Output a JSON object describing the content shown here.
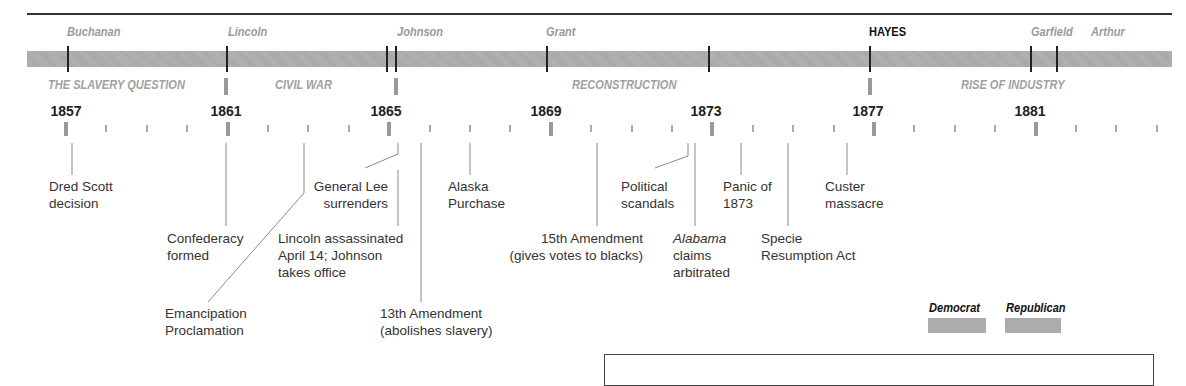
{
  "chart_data": {
    "type": "timeline",
    "title": "",
    "x_axis": {
      "start_year": 1857,
      "end_year": 1884,
      "labeled_years": [
        1857,
        1861,
        1865,
        1869,
        1873,
        1877,
        1881
      ],
      "minor_tick_interval_years": 1
    },
    "presidents": [
      {
        "name": "Buchanan",
        "start": 1857,
        "party": "Democrat"
      },
      {
        "name": "Lincoln",
        "start": 1861,
        "party": "Republican"
      },
      {
        "name": "Johnson",
        "start": 1865,
        "party": "Republican"
      },
      {
        "name": "Grant",
        "start": 1869,
        "party": "Republican"
      },
      {
        "name": "HAYES",
        "start": 1877,
        "party": "Republican",
        "highlighted": true
      },
      {
        "name": "Garfield",
        "start": 1881,
        "party": "Republican"
      },
      {
        "name": "Arthur",
        "start": 1881.7,
        "party": "Republican"
      }
    ],
    "eras": [
      {
        "label": "THE SLAVERY QUESTION",
        "start": 1857,
        "end": 1861
      },
      {
        "label": "CIVIL WAR",
        "start": 1861,
        "end": 1865
      },
      {
        "label": "RECONSTRUCTION",
        "start": 1865,
        "end": 1877
      },
      {
        "label": "RISE OF INDUSTRY",
        "start": 1877,
        "end": 1884
      }
    ],
    "events": [
      {
        "year": 1857,
        "label": "Dred Scott decision"
      },
      {
        "year": 1861,
        "label": "Confederacy formed"
      },
      {
        "year": 1863,
        "label": "Emancipation Proclamation"
      },
      {
        "year": 1865,
        "label": "General Lee surrenders"
      },
      {
        "year": 1865,
        "label": "Lincoln assassinated April 14; Johnson takes office"
      },
      {
        "year": 1865,
        "label": "13th Amendment (abolishes slavery)"
      },
      {
        "year": 1867,
        "label": "Alaska Purchase"
      },
      {
        "year": 1870,
        "label": "15th Amendment (gives votes to blacks)"
      },
      {
        "year": 1872,
        "label": "Political scandals"
      },
      {
        "year": 1872,
        "label": "Alabama claims arbitrated"
      },
      {
        "year": 1873,
        "label": "Panic of 1873"
      },
      {
        "year": 1875,
        "label": "Specie Resumption Act"
      },
      {
        "year": 1876,
        "label": "Custer massacre"
      }
    ],
    "legend": [
      {
        "label": "Democrat",
        "color": "#acacac"
      },
      {
        "label": "Republican",
        "color": "#acacac"
      }
    ]
  },
  "presidents": {
    "buchanan": "Buchanan",
    "lincoln": "Lincoln",
    "johnson": "Johnson",
    "grant": "Grant",
    "hayes": "HAYES",
    "garfield": "Garfield",
    "arthur": "Arthur"
  },
  "eras": {
    "slavery": "THE SLAVERY QUESTION",
    "civil_war": "CIVIL WAR",
    "reconstruction": "RECONSTRUCTION",
    "industry": "RISE OF INDUSTRY"
  },
  "years": {
    "y1857": "1857",
    "y1861": "1861",
    "y1865": "1865",
    "y1869": "1869",
    "y1873": "1873",
    "y1877": "1877",
    "y1881": "1881"
  },
  "events": {
    "dred_scott": "Dred Scott\ndecision",
    "confederacy": "Confederacy\nformed",
    "emancipation": "Emancipation\nProclamation",
    "lee": "General Lee\nsurrenders",
    "lincoln": "Lincoln assassinated\nApril 14; Johnson\ntakes office",
    "amend13": "13th Amendment\n(abolishes slavery)",
    "alaska": "Alaska\nPurchase",
    "amend15": "15th Amendment\n(gives votes to blacks)",
    "scandals": "Political\nscandals",
    "alabama_italic": "Alabama",
    "alabama_rest": "claims\narbitrated",
    "panic": "Panic of\n1873",
    "specie": "Specie\nResumption Act",
    "custer": "Custer\nmassacre"
  },
  "legend": {
    "democrat": "Democrat",
    "republican": "Republican"
  }
}
